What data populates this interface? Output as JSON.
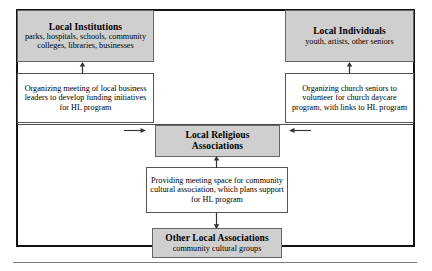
{
  "diagram": {
    "frame": {
      "label": "diagram-frame"
    },
    "boxes": {
      "local_institutions": {
        "title": "Local Institutions",
        "subtitle": "parks, hospitals, schools, community colleges, libraries, businesses"
      },
      "local_individuals": {
        "title": "Local Individuals",
        "subtitle": "youth, artists, other seniors"
      },
      "note_institutions": {
        "text": "Organizing meeting of local business leaders to develop funding initiatives for HL program"
      },
      "note_individuals": {
        "text": "Organizing church seniors to volunteer for church daycare program, with links to HL program"
      },
      "local_religious": {
        "title": "Local Religious Associations"
      },
      "note_religious": {
        "text": "Providing meeting space for community cultural association, which plans support for HL program"
      },
      "other_local": {
        "title": "Other Local Associations",
        "subtitle": "community cultural groups"
      }
    },
    "arrows": [
      {
        "name": "arrow-up-institutions",
        "direction": "up"
      },
      {
        "name": "arrow-up-individuals",
        "direction": "up"
      },
      {
        "name": "arrow-right-to-center",
        "direction": "right"
      },
      {
        "name": "arrow-left-to-center",
        "direction": "left"
      },
      {
        "name": "arrow-up-religious",
        "direction": "up"
      },
      {
        "name": "arrow-down-other",
        "direction": "down"
      }
    ],
    "colors": {
      "shaded_fill": "#cfcfcf",
      "frame_stroke": "#111111",
      "box_stroke": "#555555",
      "text": "#000000"
    }
  }
}
